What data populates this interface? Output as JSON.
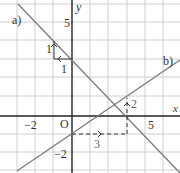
{
  "diagram": {
    "type": "coordinate-plane",
    "axes": {
      "x_label": "x",
      "y_label": "y",
      "origin_label": "O"
    },
    "ticks": {
      "x": [
        "−2",
        "5"
      ],
      "y": [
        "5",
        "−2"
      ]
    },
    "lines": [
      {
        "label": "a)",
        "equation": "y = -x + 3",
        "slope_run": "1",
        "slope_rise": "1"
      },
      {
        "label": "b)",
        "equation": "y = 2/3 x - 1",
        "slope_run": "3",
        "slope_rise": "2"
      }
    ],
    "colors": {
      "grid": "#c8c8c8",
      "axis": "#222222",
      "line": "#777777",
      "dashed": "#333333"
    }
  }
}
